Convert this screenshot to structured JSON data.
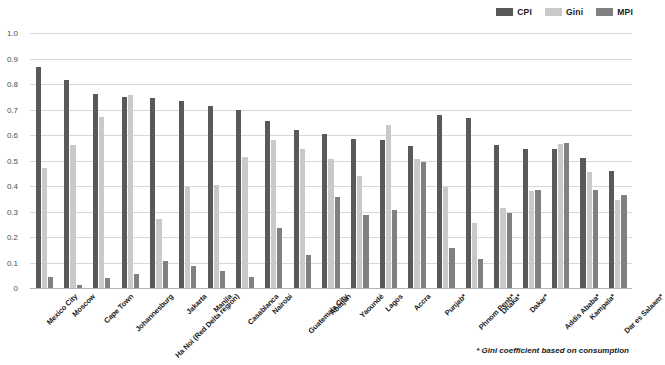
{
  "legend": {
    "position": "top-right",
    "entries": [
      {
        "name": "CPI",
        "color": "#595959"
      },
      {
        "name": "Gini",
        "color": "#c9c9c9"
      },
      {
        "name": "MPI",
        "color": "#808080"
      }
    ]
  },
  "footnote": "* Gini coefficient based on consumption",
  "axis": {
    "yticks": [
      "0",
      "0.1",
      "0.2",
      "0.3",
      "0.4",
      "0.5",
      "0.6",
      "0.7",
      "0.8",
      "0.9",
      "1.0"
    ]
  },
  "chart_data": {
    "type": "bar",
    "title": "",
    "subtitle": "",
    "xlabel": "",
    "ylabel": "",
    "ylim": [
      0,
      1.0
    ],
    "ytick_step": 0.1,
    "grid": true,
    "legend_position": "top-right",
    "annotations": [
      "* Gini coefficient based on consumption"
    ],
    "categories": [
      "Mexico City",
      "Moscow",
      "Cape Town",
      "Johannesburg",
      "Ha Noi (Red Delta region)",
      "Jakarta",
      "Manila",
      "Casablanca",
      "Nairobi",
      "Guatemala City",
      "Abidjan",
      "Yaoundé",
      "Lagos",
      "Accra",
      "Punjab*",
      "Phnom Penh*",
      "Dhaka*",
      "Dakar*",
      "Addis Ababa*",
      "Kampala*",
      "Dar es Salaam*"
    ],
    "series": [
      {
        "name": "CPI",
        "color": "#595959",
        "values": [
          0.865,
          0.815,
          0.76,
          0.75,
          0.745,
          0.735,
          0.715,
          0.7,
          0.655,
          0.62,
          0.605,
          0.585,
          0.58,
          0.555,
          0.68,
          0.665,
          0.56,
          0.545,
          0.545,
          0.51,
          0.46
        ]
      },
      {
        "name": "Gini",
        "color": "#c9c9c9",
        "values": [
          0.47,
          0.56,
          0.67,
          0.755,
          0.27,
          0.395,
          0.405,
          0.515,
          0.58,
          0.545,
          0.505,
          0.44,
          0.64,
          0.505,
          0.395,
          0.255,
          0.315,
          0.38,
          0.565,
          0.455,
          0.345
        ]
      },
      {
        "name": "MPI",
        "color": "#808080",
        "values": [
          0.045,
          0.01,
          0.04,
          0.055,
          0.105,
          0.085,
          0.065,
          0.045,
          0.235,
          0.13,
          0.355,
          0.285,
          0.305,
          0.495,
          0.155,
          0.115,
          0.295,
          0.385,
          0.57,
          0.385,
          0.365
        ]
      }
    ]
  }
}
